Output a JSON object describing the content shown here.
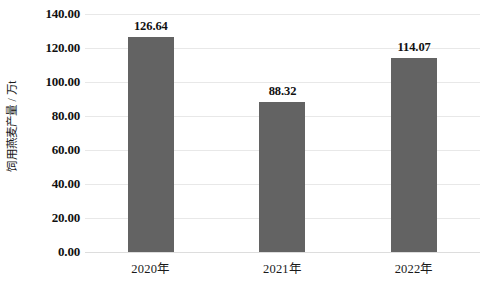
{
  "chart_data": {
    "type": "bar",
    "title": "",
    "subtitle": "",
    "xlabel": "",
    "ylabel": "饲用燕麦产量 / 万t",
    "categories": [
      "2020年",
      "2021年",
      "2022年"
    ],
    "values": [
      126.64,
      88.32,
      114.07
    ],
    "data_labels": [
      "126.64",
      "88.32",
      "114.07"
    ],
    "ylim": [
      0,
      140
    ],
    "ytick_step": 20,
    "ytick_labels": [
      "140.00",
      "120.00",
      "100.00",
      "80.00",
      "60.00",
      "40.00",
      "20.00",
      "0.00"
    ],
    "ytick_values": [
      140,
      120,
      100,
      80,
      60,
      40,
      20,
      0
    ],
    "grid": true,
    "grid_axis": "y",
    "legend": false,
    "legend_position": "none",
    "series": [
      {
        "name": "饲用燕麦产量",
        "values": [
          126.64,
          88.32,
          114.07
        ]
      }
    ],
    "colors": {
      "bar": "#636363",
      "gridline": "#e8e8e8",
      "text": "#111111",
      "background": "#ffffff"
    }
  }
}
